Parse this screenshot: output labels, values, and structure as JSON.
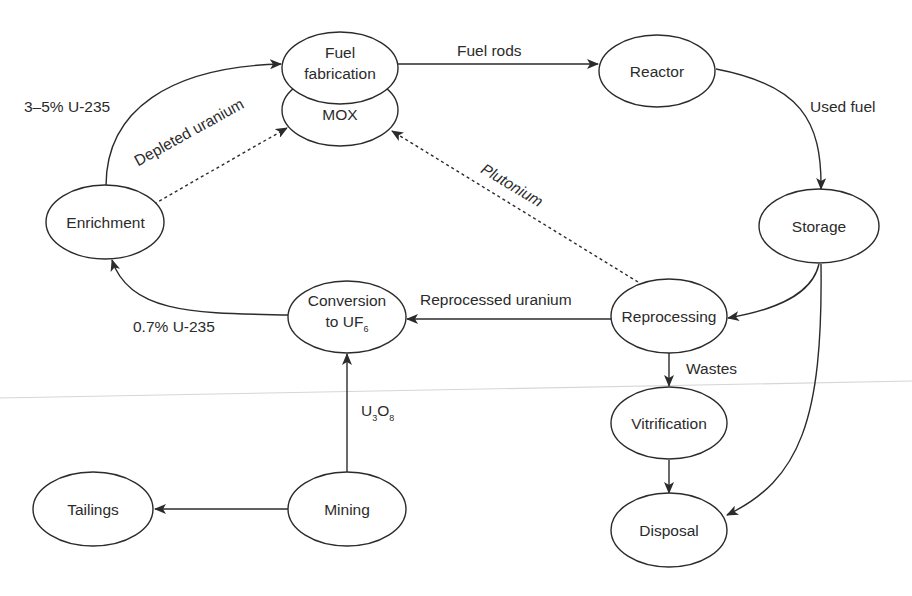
{
  "diagram": {
    "colors": {
      "stroke": "#2b2b2b",
      "background": "#ffffff",
      "scan_line": "#d6d6d6"
    },
    "nodes": {
      "fuel_fabrication": {
        "line1": "Fuel",
        "line2": "fabrication"
      },
      "mox": {
        "label": "MOX"
      },
      "reactor": {
        "label": "Reactor"
      },
      "storage": {
        "label": "Storage"
      },
      "reprocessing": {
        "label": "Reprocessing"
      },
      "enrichment": {
        "label": "Enrichment"
      },
      "conversion": {
        "line1": "Conversion",
        "line2_main": "to UF",
        "line2_sub": "6"
      },
      "mining": {
        "label": "Mining"
      },
      "tailings": {
        "label": "Tailings"
      },
      "vitrification": {
        "label": "Vitrification"
      },
      "disposal": {
        "label": "Disposal"
      }
    },
    "edges": [
      {
        "from": "Enrichment",
        "to": "Fuel fabrication",
        "label": "3–5% U-235",
        "style": "solid"
      },
      {
        "from": "Enrichment",
        "to": "MOX",
        "label": "Depleted uranium",
        "style": "dashed"
      },
      {
        "from": "Fuel fabrication",
        "to": "Reactor",
        "label": "Fuel rods",
        "style": "solid"
      },
      {
        "from": "Reactor",
        "to": "Storage",
        "label": "Used fuel",
        "style": "solid"
      },
      {
        "from": "Reprocessing",
        "to": "MOX",
        "label": "Plutonium",
        "style": "dashed"
      },
      {
        "from": "Storage",
        "to": "Reprocessing",
        "label": "",
        "style": "solid"
      },
      {
        "from": "Storage",
        "to": "Disposal",
        "label": "",
        "style": "solid"
      },
      {
        "from": "Reprocessing",
        "to": "Conversion to UF6",
        "label": "Reprocessed uranium",
        "style": "solid"
      },
      {
        "from": "Conversion to UF6",
        "to": "Enrichment",
        "label": "0.7% U-235",
        "style": "solid"
      },
      {
        "from": "Mining",
        "to": "Conversion to UF6",
        "label": "U3O8",
        "style": "solid"
      },
      {
        "from": "Mining",
        "to": "Tailings",
        "label": "",
        "style": "solid"
      },
      {
        "from": "Reprocessing",
        "to": "Vitrification",
        "label": "Wastes",
        "style": "solid"
      },
      {
        "from": "Vitrification",
        "to": "Disposal",
        "label": "",
        "style": "solid"
      }
    ],
    "edge_labels": {
      "enrich_to_fab": "3–5% U-235",
      "depleted": "Depleted uranium",
      "fuel_rods": "Fuel rods",
      "used_fuel": "Used fuel",
      "plutonium": "Plutonium",
      "reprocessed_uranium": "Reprocessed uranium",
      "natural_u": "0.7% U-235",
      "u3o8_main": "U",
      "u3o8_sub1": "3",
      "u3o8_mid": "O",
      "u3o8_sub2": "8",
      "wastes": "Wastes"
    }
  }
}
